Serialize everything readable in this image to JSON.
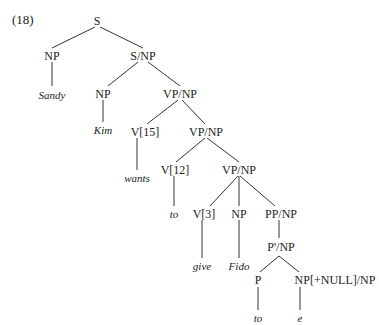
{
  "example_number": "(18)",
  "nodes": {
    "S": "S",
    "NP_subj": "NP",
    "Sandy": "Sandy",
    "S_NP": "S/NP",
    "NP_kim": "NP",
    "Kim": "Kim",
    "VP_NP_1": "VP/NP",
    "V15": "V[15]",
    "wants": "wants",
    "VP_NP_2": "VP/NP",
    "V12": "V[12]",
    "to1": "to",
    "VP_NP_3": "VP/NP",
    "V3": "V[3]",
    "give": "give",
    "NP_fido": "NP",
    "Fido": "Fido",
    "PP_NP": "PP/NP",
    "Pbar_NP": "P'/NP",
    "P": "P",
    "to2": "to",
    "NP_null": "NP[+NULL]/NP",
    "e": "e"
  }
}
